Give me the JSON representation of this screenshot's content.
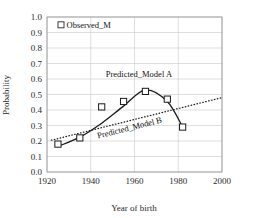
{
  "chart_data": {
    "type": "line",
    "title": "",
    "xlabel": "Year of birth",
    "ylabel": "Probability",
    "xlim": [
      1920,
      2000
    ],
    "ylim": [
      0.0,
      1.0
    ],
    "xticks": [
      "1920",
      "1940",
      "1960",
      "1980",
      "2000"
    ],
    "yticks": [
      "0.0",
      "0.1",
      "0.2",
      "0.3",
      "0.4",
      "0.5",
      "0.6",
      "0.7",
      "0.8",
      "0.9",
      "1.0"
    ],
    "grid": true,
    "legend_position": "top-left",
    "legend": [
      {
        "label": "Observed_M",
        "marker": "open-square"
      }
    ],
    "annotations": [
      {
        "label": "Predicted_Model A",
        "x": 1962,
        "y": 0.615,
        "rotation": 0
      },
      {
        "label": "Predicted_Model B",
        "x": 1958,
        "y": 0.268,
        "rotation": -14
      }
    ],
    "series": [
      {
        "name": "Observed_M",
        "type": "scatter",
        "marker": "open-square",
        "x": [
          1925,
          1935,
          1945,
          1955,
          1965,
          1975,
          1982
        ],
        "y": [
          0.18,
          0.22,
          0.42,
          0.455,
          0.52,
          0.47,
          0.29
        ]
      },
      {
        "name": "Predicted_Model A",
        "type": "line",
        "style": "solid",
        "x": [
          1925,
          1935,
          1945,
          1955,
          1965,
          1975,
          1982
        ],
        "y": [
          0.165,
          0.225,
          0.315,
          0.425,
          0.53,
          0.455,
          0.29
        ]
      },
      {
        "name": "Predicted_Model B",
        "type": "line",
        "style": "dotted",
        "x": [
          1922,
          2000
        ],
        "y": [
          0.205,
          0.48
        ]
      }
    ]
  },
  "axes": {
    "x_label": "Year of birth",
    "y_label": "Probability"
  }
}
